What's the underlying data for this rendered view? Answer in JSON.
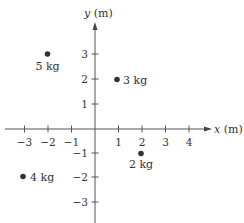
{
  "diagram": {
    "title": "",
    "x_axis": {
      "label": "x (m)",
      "label_var": "x",
      "label_unit": "(m)",
      "ticks": [
        -3,
        -2,
        -1,
        1,
        2,
        3,
        4
      ]
    },
    "y_axis": {
      "label": "y (m)",
      "label_var": "y",
      "label_unit": "(m)",
      "ticks": [
        3,
        2,
        1,
        -1,
        -2,
        -3
      ]
    },
    "masses": [
      {
        "label": "5 kg",
        "x": -2,
        "y": 3,
        "label_pos": "below"
      },
      {
        "label": "3 kg",
        "x": 1,
        "y": 2,
        "label_pos": "right"
      },
      {
        "label": "2 kg",
        "x": 2,
        "y": -1,
        "label_pos": "below"
      },
      {
        "label": "4 kg",
        "x": -3,
        "y": -2,
        "label_pos": "right"
      }
    ],
    "colors": {
      "axis": "#555555",
      "point": "#333333",
      "text": "#333333"
    }
  },
  "tick_labels": {
    "x_m3": "−3",
    "x_m2": "−2",
    "x_m1": "−1",
    "x_1": "1",
    "x_2": "2",
    "x_3": "3",
    "x_4": "4",
    "y_3": "3",
    "y_2": "2",
    "y_1": "1",
    "y_m1": "−1",
    "y_m2": "−2",
    "y_m3": "−3"
  },
  "mass_labels": {
    "m5": "5 kg",
    "m3": "3 kg",
    "m2": "2 kg",
    "m4": "4 kg"
  },
  "axis_labels": {
    "x_var": "x",
    "x_unit": " (m)",
    "y_var": "y",
    "y_unit": " (m)"
  }
}
